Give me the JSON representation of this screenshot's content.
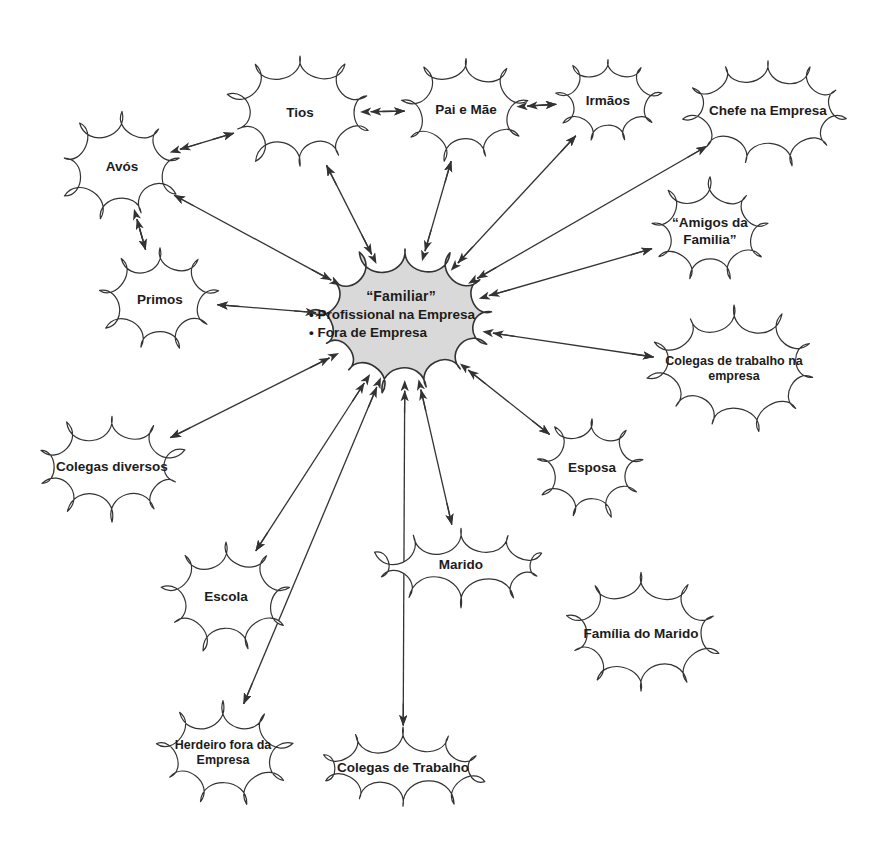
{
  "diagram": {
    "type": "concept-map",
    "background_color": "#ffffff",
    "stroke_color": "#333333",
    "center_fill_color": "#d9d9d9",
    "center_node": {
      "id": "familiar",
      "title": "“Familiar”",
      "bullets": [
        "• Profissional na Empresa",
        "• Fora de Empresa"
      ],
      "cx": 405,
      "cy": 320,
      "rx": 92,
      "ry": 72
    },
    "nodes": [
      {
        "id": "avos",
        "label": "Avós",
        "cx": 122,
        "cy": 167,
        "rx": 62,
        "ry": 54
      },
      {
        "id": "tios",
        "label": "Tios",
        "cx": 300,
        "cy": 113,
        "rx": 72,
        "ry": 57
      },
      {
        "id": "pai-e-mae",
        "label": "Pai e Mãe",
        "cx": 466,
        "cy": 110,
        "rx": 62,
        "ry": 53
      },
      {
        "id": "irmaos",
        "label": "Irmãos",
        "cx": 608,
        "cy": 101,
        "rx": 52,
        "ry": 44
      },
      {
        "id": "chefe",
        "label": "Chefe na Empresa",
        "cx": 768,
        "cy": 111,
        "rx": 82,
        "ry": 55
      },
      {
        "id": "amigos",
        "label": "“Amigos da\nFamilia”",
        "cx": 710,
        "cy": 232,
        "rx": 62,
        "ry": 52
      },
      {
        "id": "colegas-emp",
        "label": "Colegas de trabalho na\nempresa",
        "cx": 734,
        "cy": 369,
        "rx": 84,
        "ry": 62
      },
      {
        "id": "primos",
        "label": "Primos",
        "cx": 160,
        "cy": 300,
        "rx": 58,
        "ry": 52
      },
      {
        "id": "colegas-div",
        "label": "Colegas diversos",
        "cx": 112,
        "cy": 467,
        "rx": 72,
        "ry": 52
      },
      {
        "id": "esposa",
        "label": "Esposa",
        "cx": 592,
        "cy": 468,
        "rx": 56,
        "ry": 52
      },
      {
        "id": "marido",
        "label": "Marido",
        "cx": 461,
        "cy": 565,
        "rx": 88,
        "ry": 40
      },
      {
        "id": "familia-mar",
        "label": "Família do Marido",
        "cx": 641,
        "cy": 634,
        "rx": 76,
        "ry": 58
      },
      {
        "id": "escola",
        "label": "Escola",
        "cx": 226,
        "cy": 597,
        "rx": 62,
        "ry": 53
      },
      {
        "id": "herdeiro",
        "label": "Herdeiro fora da\nEmpresa",
        "cx": 223,
        "cy": 753,
        "rx": 66,
        "ry": 52
      },
      {
        "id": "colegas-trab",
        "label": "Colegas de Trabalho",
        "cx": 403,
        "cy": 768,
        "rx": 82,
        "ry": 42
      }
    ],
    "edges": [
      {
        "from": "avos",
        "to": "tios",
        "kind": "double"
      },
      {
        "from": "tios",
        "to": "pai-e-mae",
        "kind": "double"
      },
      {
        "from": "pai-e-mae",
        "to": "irmaos",
        "kind": "double"
      },
      {
        "from": "avos",
        "to": "primos",
        "kind": "double"
      },
      {
        "from": "familiar",
        "to": "avos",
        "kind": "double"
      },
      {
        "from": "familiar",
        "to": "tios",
        "kind": "double"
      },
      {
        "from": "familiar",
        "to": "primos",
        "kind": "double"
      },
      {
        "from": "familiar",
        "to": "pai-e-mae",
        "kind": "double"
      },
      {
        "from": "familiar",
        "to": "irmaos",
        "kind": "double"
      },
      {
        "from": "familiar",
        "to": "chefe",
        "kind": "double"
      },
      {
        "from": "familiar",
        "to": "amigos",
        "kind": "double"
      },
      {
        "from": "familiar",
        "to": "colegas-emp",
        "kind": "double"
      },
      {
        "from": "familiar",
        "to": "esposa",
        "kind": "double"
      },
      {
        "from": "familiar",
        "to": "marido",
        "kind": "double"
      },
      {
        "from": "familiar",
        "to": "colegas-div",
        "kind": "double"
      },
      {
        "from": "familiar",
        "to": "escola",
        "kind": "double"
      },
      {
        "from": "familiar",
        "to": "herdeiro",
        "kind": "double"
      },
      {
        "from": "familiar",
        "to": "colegas-trab",
        "kind": "double"
      }
    ]
  }
}
